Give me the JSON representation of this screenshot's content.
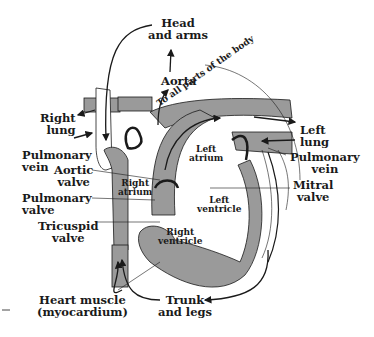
{
  "diagram": {
    "colors": {
      "vessel": "#9a9a9a",
      "line": "#1a1a1a",
      "background": "#ffffff"
    },
    "labels": {
      "head_arms": [
        "Head",
        "and arms"
      ],
      "aorta": "Aorta",
      "to_all_parts": "To all parts of the body",
      "right_lung": [
        "Right",
        "lung"
      ],
      "left_lung": [
        "Left",
        "lung"
      ],
      "pulmonary_vein_left_side": [
        "Pulmonary",
        "vein"
      ],
      "pulmonary_vein_right_side": [
        "Pulmonary",
        "vein"
      ],
      "aortic_valve": [
        "Aortic",
        "valve"
      ],
      "pulmonary_valve": [
        "Pulmonary",
        "valve"
      ],
      "tricuspid_valve": [
        "Tricuspid",
        "valve"
      ],
      "mitral_valve": [
        "Mitral",
        "valve"
      ],
      "left_atrium": [
        "Left",
        "atrium"
      ],
      "right_atrium": [
        "Right",
        "atrium"
      ],
      "left_ventricle": [
        "Left",
        "ventricle"
      ],
      "right_ventricle": [
        "Right",
        "ventricle"
      ],
      "heart_muscle": [
        "Heart muscle",
        "(myocardium)"
      ],
      "trunk_legs": [
        "Trunk",
        "and legs"
      ]
    }
  }
}
